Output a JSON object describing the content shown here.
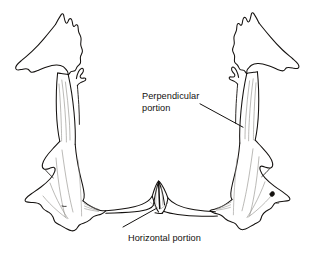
{
  "figure": {
    "background_color": "#ffffff",
    "ink_color": "#14110f",
    "shade_color": "#8d8b87",
    "width": 318,
    "height": 259
  },
  "labels": {
    "perpendicular": {
      "line1": "Perpendicular",
      "line2": "portion"
    },
    "horizontal": {
      "line1": "Horizontal portion"
    }
  },
  "parts": {
    "left_bone": "left-palatine-bone",
    "right_bone": "right-palatine-bone",
    "nasal_crest": "posterior-nasal-spine",
    "horizontal_plate": "horizontal-plate",
    "left_hook": "left-sphenoidal-process",
    "right_hook": "right-sphenoidal-process",
    "foramen": "greater-palatine-foramen"
  }
}
